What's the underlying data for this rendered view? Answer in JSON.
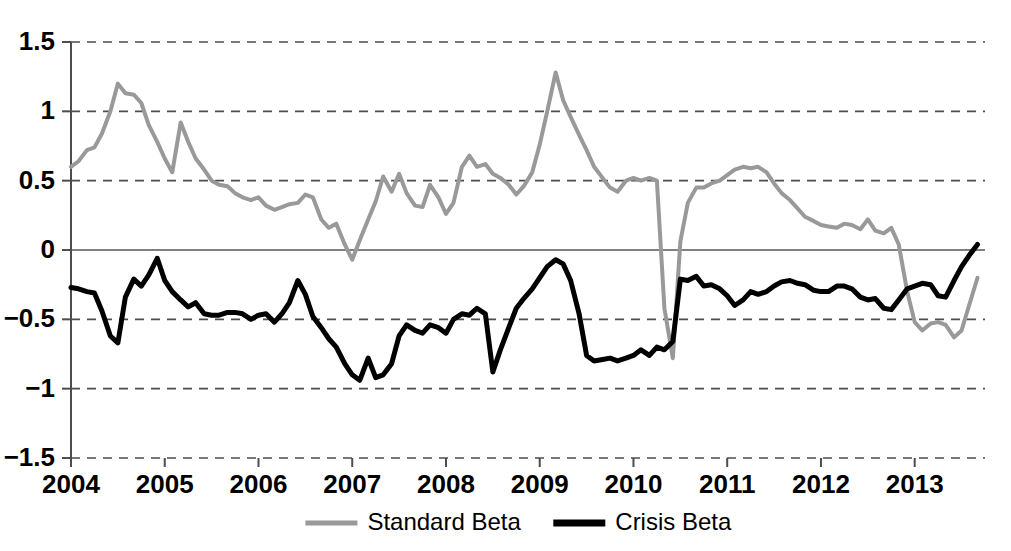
{
  "chart_data": {
    "type": "line",
    "title": "",
    "xlabel": "",
    "ylabel": "",
    "xlim": [
      2004.0,
      2013.75
    ],
    "ylim": [
      -1.5,
      1.5
    ],
    "grid": true,
    "grid_axis": "y",
    "legend_position": "bottom-center",
    "yticks": [
      1.5,
      1,
      0.5,
      0,
      -0.5,
      -1,
      -1.5
    ],
    "ytick_labels": [
      "1.5",
      "1",
      "0.5",
      "0",
      "−0.5",
      "−1",
      "−1.5"
    ],
    "xticks": [
      2004,
      2005,
      2006,
      2007,
      2008,
      2009,
      2010,
      2011,
      2012,
      2013
    ],
    "xtick_labels": [
      "2004",
      "2005",
      "2006",
      "2007",
      "2008",
      "2009",
      "2010",
      "2011",
      "2012",
      "2013"
    ],
    "colors": {
      "standard_beta": "#999999",
      "crisis_beta": "#000000",
      "gridline": "#4d4d4d",
      "zeroline": "#808080",
      "background": "#ffffff"
    },
    "series": [
      {
        "name": "Standard Beta",
        "color": "#999999",
        "linewidth": 4,
        "x": [
          2004.0,
          2004.08,
          2004.17,
          2004.25,
          2004.33,
          2004.42,
          2004.5,
          2004.58,
          2004.67,
          2004.75,
          2004.83,
          2004.92,
          2005.0,
          2005.08,
          2005.17,
          2005.25,
          2005.33,
          2005.42,
          2005.5,
          2005.58,
          2005.67,
          2005.75,
          2005.83,
          2005.92,
          2006.0,
          2006.08,
          2006.17,
          2006.25,
          2006.33,
          2006.42,
          2006.5,
          2006.58,
          2006.67,
          2006.75,
          2006.83,
          2006.92,
          2007.0,
          2007.08,
          2007.17,
          2007.25,
          2007.33,
          2007.42,
          2007.5,
          2007.58,
          2007.67,
          2007.75,
          2007.83,
          2007.92,
          2008.0,
          2008.08,
          2008.17,
          2008.25,
          2008.33,
          2008.42,
          2008.5,
          2008.58,
          2008.67,
          2008.75,
          2008.83,
          2008.92,
          2009.0,
          2009.08,
          2009.17,
          2009.25,
          2009.33,
          2009.42,
          2009.5,
          2009.58,
          2009.67,
          2009.75,
          2009.83,
          2009.92,
          2010.0,
          2010.08,
          2010.17,
          2010.25,
          2010.33,
          2010.42,
          2010.5,
          2010.58,
          2010.67,
          2010.75,
          2010.83,
          2010.92,
          2011.0,
          2011.08,
          2011.17,
          2011.25,
          2011.33,
          2011.42,
          2011.5,
          2011.58,
          2011.67,
          2011.75,
          2011.83,
          2011.92,
          2012.0,
          2012.08,
          2012.17,
          2012.25,
          2012.33,
          2012.42,
          2012.5,
          2012.58,
          2012.67,
          2012.75,
          2012.83,
          2012.92,
          2013.0,
          2013.08,
          2013.17,
          2013.25,
          2013.33,
          2013.42,
          2013.5,
          2013.58,
          2013.67
        ],
        "values": [
          0.6,
          0.64,
          0.72,
          0.74,
          0.84,
          1.0,
          1.2,
          1.13,
          1.12,
          1.06,
          0.9,
          0.78,
          0.66,
          0.56,
          0.92,
          0.78,
          0.66,
          0.58,
          0.5,
          0.47,
          0.46,
          0.41,
          0.38,
          0.36,
          0.38,
          0.32,
          0.29,
          0.31,
          0.33,
          0.34,
          0.4,
          0.38,
          0.22,
          0.16,
          0.19,
          0.04,
          -0.07,
          0.07,
          0.22,
          0.35,
          0.53,
          0.42,
          0.55,
          0.41,
          0.32,
          0.31,
          0.47,
          0.38,
          0.26,
          0.34,
          0.6,
          0.68,
          0.6,
          0.62,
          0.55,
          0.52,
          0.47,
          0.4,
          0.46,
          0.56,
          0.76,
          1.0,
          1.28,
          1.08,
          0.96,
          0.83,
          0.72,
          0.6,
          0.52,
          0.45,
          0.42,
          0.5,
          0.52,
          0.5,
          0.52,
          0.5,
          -0.42,
          -0.78,
          -0.8,
          -0.82,
          -0.78,
          -0.84,
          -0.78,
          -0.72,
          -0.8,
          -0.74,
          -0.68,
          -0.72,
          -0.78,
          -0.72,
          -0.68,
          -0.7,
          -0.72,
          -0.68,
          -0.7,
          -0.72,
          -0.74,
          -0.78,
          -0.86,
          -0.92,
          -0.94,
          -0.88,
          -0.86,
          -0.92,
          -0.97,
          -0.99,
          -1.0,
          -0.98,
          -0.96,
          -0.52,
          0.06,
          0.34,
          0.45,
          0.48,
          0.5,
          0.53,
          0.55
        ],
        "note": "first half; continues in values_cont"
      },
      {
        "name": "Crisis Beta",
        "color": "#000000",
        "linewidth": 5,
        "x": [
          2004.0,
          2004.08,
          2004.17,
          2004.25,
          2004.33,
          2004.42,
          2004.5,
          2004.58,
          2004.67,
          2004.75,
          2004.83,
          2004.92,
          2005.0,
          2005.08,
          2005.17,
          2005.25,
          2005.33,
          2005.42,
          2005.5,
          2005.58,
          2005.67,
          2005.75,
          2005.83,
          2005.92,
          2006.0,
          2006.08,
          2006.17,
          2006.25,
          2006.33,
          2006.42,
          2006.5,
          2006.58,
          2006.67,
          2006.75,
          2006.83,
          2006.92,
          2007.0,
          2007.08,
          2007.17,
          2007.25,
          2007.33,
          2007.42,
          2007.5,
          2007.58,
          2007.67,
          2007.75,
          2007.83,
          2007.92,
          2008.0,
          2008.08,
          2008.17,
          2008.25,
          2008.33,
          2008.42,
          2008.5,
          2008.58,
          2008.67,
          2008.75,
          2008.83,
          2008.92,
          2009.0,
          2009.08,
          2009.17,
          2009.25,
          2009.33,
          2009.42,
          2009.5,
          2009.58,
          2009.67,
          2009.75,
          2009.83,
          2009.92,
          2010.0,
          2010.08,
          2010.17,
          2010.25,
          2010.33,
          2010.42,
          2010.5,
          2010.58,
          2010.67,
          2010.75,
          2010.83,
          2010.92,
          2011.0,
          2011.08,
          2011.17,
          2011.25,
          2011.33,
          2011.42,
          2011.5,
          2011.58,
          2011.67,
          2011.75,
          2011.83,
          2011.92,
          2012.0,
          2012.08,
          2012.17,
          2012.25,
          2012.33,
          2012.42,
          2012.5,
          2012.58,
          2012.67,
          2012.75,
          2012.83,
          2012.92,
          2013.0,
          2013.08,
          2013.17,
          2013.25,
          2013.33,
          2013.42,
          2013.5,
          2013.58,
          2013.67
        ],
        "values": [
          -0.27,
          -0.28,
          -0.3,
          -0.31,
          -0.44,
          -0.62,
          -0.67,
          -0.34,
          -0.21,
          -0.26,
          -0.18,
          -0.06,
          -0.22,
          -0.3,
          -0.36,
          -0.41,
          -0.38,
          -0.46,
          -0.47,
          -0.47,
          -0.45,
          -0.45,
          -0.46,
          -0.5,
          -0.47,
          -0.46,
          -0.52,
          -0.46,
          -0.38,
          -0.22,
          -0.32,
          -0.48,
          -0.56,
          -0.64,
          -0.7,
          -0.82,
          -0.9,
          -0.94,
          -0.78,
          -0.92,
          -0.9,
          -0.82,
          -0.62,
          -0.54,
          -0.58,
          -0.6,
          -0.54,
          -0.56,
          -0.6,
          -0.5,
          -0.46,
          -0.47,
          -0.42,
          -0.46,
          -0.88,
          -0.72,
          -0.56,
          -0.42,
          -0.35,
          -0.28,
          -0.2,
          -0.12,
          -0.07,
          -0.1,
          -0.22,
          -0.46,
          -0.76,
          -0.8,
          -0.79,
          -0.78,
          -0.8,
          -0.78,
          -0.76,
          -0.72,
          -0.76,
          -0.7,
          -0.72,
          -0.66,
          -0.7,
          -0.74,
          -0.68,
          -0.72,
          -0.78,
          -0.8,
          -0.74,
          -0.78,
          -0.74,
          -0.76,
          -0.74,
          -0.76,
          -0.75,
          -0.75,
          -0.76,
          -0.75,
          -0.74,
          -0.76,
          -0.76,
          -0.78,
          -0.8,
          -0.86,
          -0.94,
          -1.0,
          -0.76,
          -0.74,
          -0.74,
          -0.75,
          -0.74,
          -0.74,
          -0.72,
          -0.52,
          -0.21,
          -0.22,
          -0.3,
          -0.26,
          -0.32,
          -0.34,
          -0.3
        ],
        "note": "first half; continues in values_cont"
      }
    ],
    "series_cont": [
      {
        "name": "Standard Beta",
        "x": [
          2010.5,
          2010.58,
          2010.67,
          2010.75,
          2010.83,
          2010.92,
          2011.0,
          2011.08,
          2011.17,
          2011.25,
          2011.33,
          2011.42,
          2011.5,
          2011.58,
          2011.67,
          2011.75,
          2011.83,
          2011.92,
          2012.0,
          2012.08,
          2012.17,
          2012.25,
          2012.33,
          2012.42,
          2012.5,
          2012.58,
          2012.67,
          2012.75,
          2012.83,
          2012.92,
          2013.0,
          2013.08,
          2013.17,
          2013.25,
          2013.33,
          2013.42,
          2013.5,
          2013.58,
          2013.67
        ],
        "values": [
          0.06,
          0.34,
          0.45,
          0.45,
          0.48,
          0.5,
          0.54,
          0.58,
          0.6,
          0.59,
          0.6,
          0.56,
          0.48,
          0.41,
          0.36,
          0.3,
          0.24,
          0.21,
          0.18,
          0.17,
          0.16,
          0.19,
          0.18,
          0.15,
          0.22,
          0.14,
          0.12,
          0.16,
          0.04,
          -0.3,
          -0.52,
          -0.58,
          -0.53,
          -0.52,
          -0.54,
          -0.63,
          -0.58,
          -0.4,
          -0.2
        ]
      },
      {
        "name": "Crisis Beta",
        "x": [
          2010.5,
          2010.58,
          2010.67,
          2010.75,
          2010.83,
          2010.92,
          2011.0,
          2011.08,
          2011.17,
          2011.25,
          2011.33,
          2011.42,
          2011.5,
          2011.58,
          2011.67,
          2011.75,
          2011.83,
          2011.92,
          2012.0,
          2012.08,
          2012.17,
          2012.25,
          2012.33,
          2012.42,
          2012.5,
          2012.58,
          2012.67,
          2012.75,
          2012.83,
          2012.92,
          2013.0,
          2013.08,
          2013.17,
          2013.25,
          2013.33,
          2013.42,
          2013.5,
          2013.58,
          2013.67
        ],
        "values": [
          -0.21,
          -0.22,
          -0.19,
          -0.26,
          -0.25,
          -0.28,
          -0.33,
          -0.4,
          -0.36,
          -0.3,
          -0.32,
          -0.3,
          -0.26,
          -0.23,
          -0.22,
          -0.24,
          -0.25,
          -0.29,
          -0.3,
          -0.3,
          -0.26,
          -0.26,
          -0.28,
          -0.34,
          -0.36,
          -0.35,
          -0.42,
          -0.43,
          -0.36,
          -0.28,
          -0.26,
          -0.24,
          -0.25,
          -0.33,
          -0.34,
          -0.22,
          -0.12,
          -0.04,
          0.04
        ]
      }
    ],
    "annotations": []
  },
  "legend": {
    "items": [
      {
        "label": "Standard Beta",
        "color": "#999999",
        "linewidth": 5
      },
      {
        "label": "Crisis Beta",
        "color": "#000000",
        "linewidth": 7
      }
    ]
  }
}
